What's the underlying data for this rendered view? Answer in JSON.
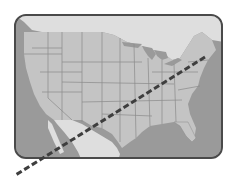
{
  "map": {
    "title": "",
    "region": "United States (contiguous)",
    "style": "grayscale",
    "colors": {
      "water": "#9a9a9a",
      "us_land": "#c4c4c4",
      "neighbor_land": "#dedede",
      "state_border": "#8a8a8a",
      "frame_border": "#4a4a4a",
      "route_line": "#3e3e3e"
    },
    "route": {
      "style": "dashed",
      "from_label": "",
      "to_label": "",
      "description": "Dashed line from northeast US (New England coast) extending southwest across the country and beyond the frame"
    }
  }
}
